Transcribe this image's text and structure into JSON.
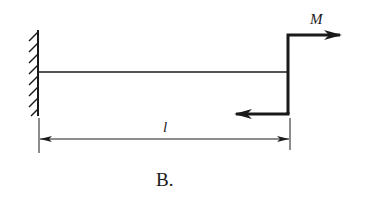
{
  "diagram": {
    "type": "cantilever-beam",
    "support": "fixed-wall-left",
    "load": {
      "type": "concentrated-moment",
      "label": "M",
      "position": "free-end"
    },
    "dimension": {
      "label": "l"
    },
    "caption": "B."
  },
  "colors": {
    "stroke": "#1a1a1a",
    "background": "#ffffff"
  }
}
